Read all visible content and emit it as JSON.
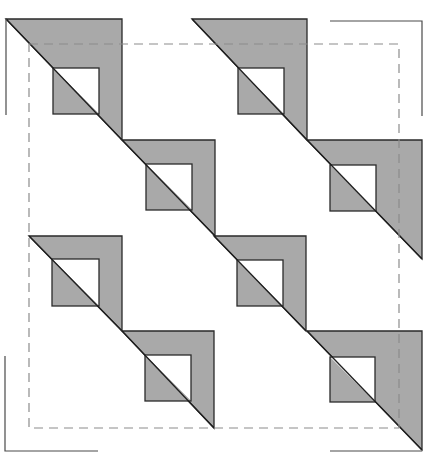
{
  "diagram": {
    "title": "",
    "canvas": {
      "width": 445,
      "height": 470,
      "background": "#ffffff"
    },
    "colors": {
      "fill_gray": "#a9a9a9",
      "fill_white": "#ffffff",
      "stroke": "#2a2a2a",
      "crop_mark": "#4a4a4a",
      "dashed_frame": "#8c8c8c"
    },
    "pattern": "quilt-block: 8 right-triangle units with inset half-shaded squares along diagonals",
    "units": [
      {
        "id": "unit-1",
        "triangle": {
          "x1": 6,
          "y1": 19,
          "x2": 122,
          "y2": 140
        },
        "square": {
          "x": 53,
          "y": 68,
          "size": 46
        }
      },
      {
        "id": "unit-2",
        "triangle": {
          "x1": 122,
          "y1": 140,
          "x2": 215,
          "y2": 236
        },
        "square": {
          "x": 146,
          "y": 164,
          "size": 46
        }
      },
      {
        "id": "unit-3",
        "triangle": {
          "x1": 192,
          "y1": 19,
          "x2": 307,
          "y2": 140
        },
        "square": {
          "x": 238,
          "y": 68,
          "size": 46
        }
      },
      {
        "id": "unit-4",
        "triangle": {
          "x1": 307,
          "y1": 140,
          "x2": 422,
          "y2": 259
        },
        "square": {
          "x": 330,
          "y": 165,
          "size": 46
        }
      },
      {
        "id": "unit-5",
        "triangle": {
          "x1": 29,
          "y1": 236,
          "x2": 122,
          "y2": 331
        },
        "square": {
          "x": 52,
          "y": 259,
          "size": 47
        }
      },
      {
        "id": "unit-6",
        "triangle": {
          "x1": 122,
          "y1": 331,
          "x2": 214,
          "y2": 428
        },
        "square": {
          "x": 145,
          "y": 355,
          "size": 46
        }
      },
      {
        "id": "unit-7",
        "triangle": {
          "x1": 214,
          "y1": 236,
          "x2": 306,
          "y2": 331
        },
        "square": {
          "x": 237,
          "y": 260,
          "size": 46
        }
      },
      {
        "id": "unit-8",
        "triangle": {
          "x1": 307,
          "y1": 331,
          "x2": 422,
          "y2": 450
        },
        "square": {
          "x": 330,
          "y": 357,
          "size": 45
        }
      }
    ],
    "dashed_frame": {
      "x": 29,
      "y": 44,
      "width": 370,
      "height": 384
    },
    "crop_marks": [
      {
        "id": "top-left",
        "points": "6,115 6,19"
      },
      {
        "id": "top-right",
        "points": "330,21 422,21 422,116"
      },
      {
        "id": "bottom-left",
        "points": "5,356 5,451 98,451"
      },
      {
        "id": "bottom-right",
        "points": "330,451 422,451"
      }
    ]
  }
}
